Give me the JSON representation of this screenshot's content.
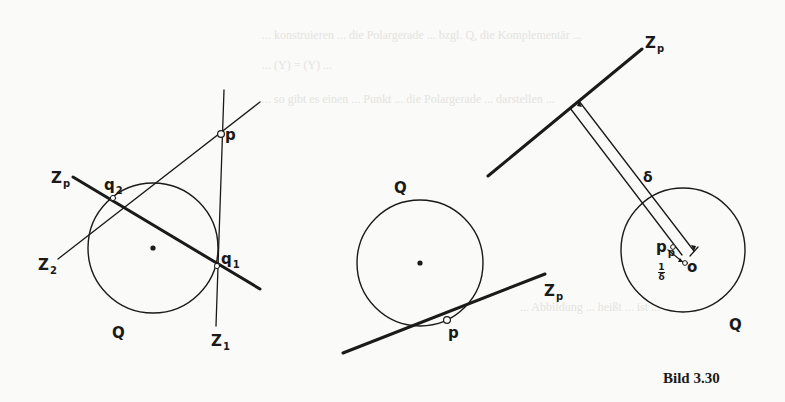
{
  "caption": "Bild 3.30",
  "figures": [
    {
      "id": "left",
      "labels": {
        "p": "p",
        "q1": "q",
        "q1_sub": "1",
        "q2": "q",
        "q2_sub": "2",
        "zp": "Z",
        "zp_sub": "p",
        "z1": "Z",
        "z1_sub": "1",
        "z2": "Z",
        "z2_sub": "2",
        "Q": "Q"
      }
    },
    {
      "id": "middle",
      "labels": {
        "Q": "Q",
        "p": "p",
        "zp": "Z",
        "zp_sub": "p"
      }
    },
    {
      "id": "right",
      "labels": {
        "zp": "Z",
        "zp_sub": "p",
        "delta": "δ",
        "pp": "p",
        "pp_sub": "p",
        "o": "o",
        "frac_num": "1",
        "frac_den": "δ",
        "Q": "Q"
      }
    }
  ],
  "background_text": [
    "... konstruieren ... die Polargerade ... bzgl. Q, die Komplementär ...",
    "... (Y) = (Y) ...",
    "... so gibt es einen ... Punkt ... die Polargerade ... darstellen ...",
    "... Abbildung ... heißt ... ist ...",
    "Bild 3.30"
  ]
}
